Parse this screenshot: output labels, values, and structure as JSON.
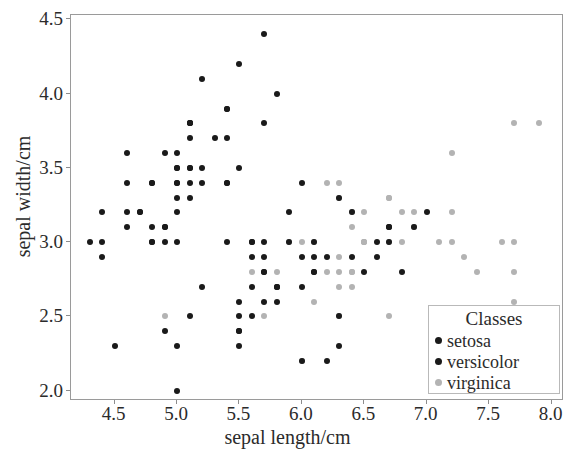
{
  "chart_data": {
    "type": "scatter",
    "title": "",
    "xlabel": "sepal length/cm",
    "ylabel": "sepal width/cm",
    "xlim": [
      4.15,
      8.1
    ],
    "ylim": [
      1.93,
      4.53
    ],
    "xticks": [
      4.5,
      5.0,
      5.5,
      6.0,
      6.5,
      7.0,
      7.5,
      8.0
    ],
    "xtick_labels": [
      "4.5",
      "5.0",
      "5.5",
      "6.0",
      "6.5",
      "7.0",
      "7.5",
      "8.0"
    ],
    "yticks": [
      2.0,
      2.5,
      3.0,
      3.5,
      4.0,
      4.5
    ],
    "ytick_labels": [
      "2.0",
      "2.5",
      "3.0",
      "3.5",
      "4.0",
      "4.5"
    ],
    "grid": false,
    "legend_position": "lower right",
    "legend_title": "Classes",
    "series": [
      {
        "name": "setosa",
        "color": "#1a1a1a",
        "points": [
          [
            5.1,
            3.5
          ],
          [
            4.9,
            3.0
          ],
          [
            4.7,
            3.2
          ],
          [
            4.6,
            3.1
          ],
          [
            5.0,
            3.6
          ],
          [
            5.4,
            3.9
          ],
          [
            4.6,
            3.4
          ],
          [
            5.0,
            3.4
          ],
          [
            4.4,
            2.9
          ],
          [
            4.9,
            3.1
          ],
          [
            5.4,
            3.7
          ],
          [
            4.8,
            3.4
          ],
          [
            4.8,
            3.0
          ],
          [
            4.3,
            3.0
          ],
          [
            5.8,
            4.0
          ],
          [
            5.7,
            4.4
          ],
          [
            5.4,
            3.9
          ],
          [
            5.1,
            3.5
          ],
          [
            5.7,
            3.8
          ],
          [
            5.1,
            3.8
          ],
          [
            5.4,
            3.4
          ],
          [
            5.1,
            3.7
          ],
          [
            4.6,
            3.6
          ],
          [
            5.1,
            3.3
          ],
          [
            4.8,
            3.4
          ],
          [
            5.0,
            3.0
          ],
          [
            5.0,
            3.4
          ],
          [
            5.2,
            3.5
          ],
          [
            5.2,
            3.4
          ],
          [
            4.7,
            3.2
          ],
          [
            4.8,
            3.1
          ],
          [
            5.4,
            3.4
          ],
          [
            5.2,
            4.1
          ],
          [
            5.5,
            4.2
          ],
          [
            4.9,
            3.1
          ],
          [
            5.0,
            3.2
          ],
          [
            5.5,
            3.5
          ],
          [
            4.9,
            3.6
          ],
          [
            4.4,
            3.0
          ],
          [
            5.1,
            3.4
          ],
          [
            5.0,
            3.5
          ],
          [
            4.5,
            2.3
          ],
          [
            4.4,
            3.2
          ],
          [
            5.0,
            3.5
          ],
          [
            5.1,
            3.8
          ],
          [
            4.8,
            3.0
          ],
          [
            5.1,
            3.8
          ],
          [
            4.6,
            3.2
          ],
          [
            5.3,
            3.7
          ],
          [
            5.0,
            3.3
          ]
        ]
      },
      {
        "name": "versicolor",
        "color": "#1a1a1a",
        "points": [
          [
            7.0,
            3.2
          ],
          [
            6.4,
            3.2
          ],
          [
            6.9,
            3.1
          ],
          [
            5.5,
            2.3
          ],
          [
            6.5,
            2.8
          ],
          [
            5.7,
            2.8
          ],
          [
            6.3,
            3.3
          ],
          [
            4.9,
            2.4
          ],
          [
            6.6,
            2.9
          ],
          [
            5.2,
            2.7
          ],
          [
            5.0,
            2.0
          ],
          [
            5.9,
            3.0
          ],
          [
            6.0,
            2.2
          ],
          [
            6.1,
            2.9
          ],
          [
            5.6,
            2.9
          ],
          [
            6.7,
            3.1
          ],
          [
            5.6,
            3.0
          ],
          [
            5.8,
            2.7
          ],
          [
            6.2,
            2.2
          ],
          [
            5.6,
            2.5
          ],
          [
            5.9,
            3.2
          ],
          [
            6.1,
            2.8
          ],
          [
            6.3,
            2.5
          ],
          [
            6.1,
            2.8
          ],
          [
            6.4,
            2.9
          ],
          [
            6.6,
            3.0
          ],
          [
            6.8,
            2.8
          ],
          [
            6.7,
            3.0
          ],
          [
            6.0,
            2.9
          ],
          [
            5.7,
            2.6
          ],
          [
            5.5,
            2.4
          ],
          [
            5.5,
            2.4
          ],
          [
            5.8,
            2.7
          ],
          [
            6.0,
            2.7
          ],
          [
            5.4,
            3.0
          ],
          [
            6.0,
            3.4
          ],
          [
            6.7,
            3.1
          ],
          [
            6.3,
            2.3
          ],
          [
            5.6,
            3.0
          ],
          [
            5.5,
            2.5
          ],
          [
            5.5,
            2.6
          ],
          [
            6.1,
            3.0
          ],
          [
            5.8,
            2.6
          ],
          [
            5.0,
            2.3
          ],
          [
            5.6,
            2.7
          ],
          [
            5.7,
            3.0
          ],
          [
            5.7,
            2.9
          ],
          [
            6.2,
            2.9
          ],
          [
            5.1,
            2.5
          ],
          [
            5.7,
            2.8
          ]
        ]
      },
      {
        "name": "virginica",
        "color": "#b3b3b3",
        "points": [
          [
            6.3,
            3.3
          ],
          [
            5.8,
            2.7
          ],
          [
            7.1,
            3.0
          ],
          [
            6.3,
            2.9
          ],
          [
            6.5,
            3.0
          ],
          [
            7.6,
            3.0
          ],
          [
            4.9,
            2.5
          ],
          [
            7.3,
            2.9
          ],
          [
            6.7,
            2.5
          ],
          [
            7.2,
            3.6
          ],
          [
            6.5,
            3.2
          ],
          [
            6.4,
            2.7
          ],
          [
            6.8,
            3.0
          ],
          [
            5.7,
            2.5
          ],
          [
            5.8,
            2.8
          ],
          [
            6.4,
            3.2
          ],
          [
            6.5,
            3.0
          ],
          [
            7.7,
            3.8
          ],
          [
            7.7,
            2.6
          ],
          [
            6.0,
            2.2
          ],
          [
            6.9,
            3.2
          ],
          [
            5.6,
            2.8
          ],
          [
            7.7,
            2.8
          ],
          [
            6.3,
            2.7
          ],
          [
            6.7,
            3.3
          ],
          [
            7.2,
            3.2
          ],
          [
            6.2,
            2.8
          ],
          [
            6.1,
            3.0
          ],
          [
            6.4,
            2.8
          ],
          [
            7.2,
            3.0
          ],
          [
            7.4,
            2.8
          ],
          [
            7.9,
            3.8
          ],
          [
            6.4,
            2.8
          ],
          [
            6.3,
            2.8
          ],
          [
            6.1,
            2.6
          ],
          [
            7.7,
            3.0
          ],
          [
            6.3,
            3.4
          ],
          [
            6.4,
            3.1
          ],
          [
            6.0,
            3.0
          ],
          [
            6.9,
            3.1
          ],
          [
            6.7,
            3.1
          ],
          [
            6.9,
            3.1
          ],
          [
            5.8,
            2.7
          ],
          [
            6.8,
            3.2
          ],
          [
            6.7,
            3.3
          ],
          [
            6.7,
            3.0
          ],
          [
            6.3,
            2.5
          ],
          [
            6.5,
            3.0
          ],
          [
            6.2,
            3.4
          ],
          [
            5.9,
            3.0
          ]
        ]
      }
    ]
  },
  "legend": {
    "title": "Classes",
    "entries": [
      {
        "label": "setosa",
        "color": "#1a1a1a"
      },
      {
        "label": "versicolor",
        "color": "#1a1a1a"
      },
      {
        "label": "virginica",
        "color": "#b3b3b3"
      }
    ]
  },
  "axes": {
    "xlabel": "sepal length/cm",
    "ylabel": "sepal width/cm"
  }
}
